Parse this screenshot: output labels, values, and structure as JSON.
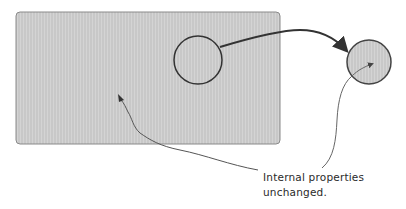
{
  "diagram": {
    "object_region": {
      "shape": "rounded-rectangle",
      "fill": "#cfcfcf",
      "stroke": "#8a8a8a"
    },
    "source_circle": {
      "shape": "circle",
      "stroke": "#333333"
    },
    "target_circle": {
      "shape": "circle",
      "fill": "#cfcfcf",
      "stroke": "#444444"
    },
    "move_arrow": {
      "from": "source_circle",
      "to": "target_circle",
      "color": "#333333"
    },
    "annotation": {
      "lines": [
        "Internal properties",
        "unchanged."
      ],
      "color": "#2a2a2a",
      "pointers": [
        "object_region",
        "target_circle"
      ]
    }
  }
}
